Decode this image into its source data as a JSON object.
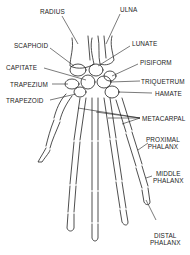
{
  "diagram": {
    "labels": {
      "radius": "RADIUS",
      "ulna": "ULNA",
      "scaphoid": "SCAPHOID",
      "lunate": "LUNATE",
      "capitate": "CAPITATE",
      "pisiform": "PISIFORM",
      "trapezium": "TRAPEZIUM",
      "triquetrum": "TRIQUETRUM",
      "trapezoid": "TRAPEZOID",
      "hamate": "HAMATE",
      "metacarpal": "METACARPAL",
      "proximal_phalanx_1": "PROXIMAL",
      "proximal_phalanx_2": "PHALANX",
      "middle_phalanx_1": "MIDDLE",
      "middle_phalanx_2": "PHALANX",
      "distal_phalanx_1": "DISTAL",
      "distal_phalanx_2": "PHALANX"
    },
    "colors": {
      "line": "#222222",
      "background": "#ffffff"
    }
  }
}
